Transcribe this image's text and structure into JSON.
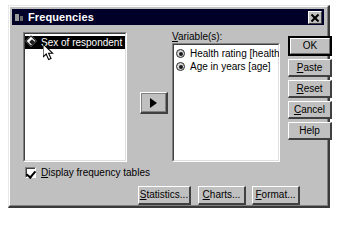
{
  "window": {
    "title": "Frequencies",
    "icon": "spss-dialog-icon",
    "close_label": "X"
  },
  "source_list": {
    "items": [
      {
        "label": "Sex of respondent [sex]",
        "icon": "nominal-variable-icon",
        "selected": true
      }
    ]
  },
  "target_list": {
    "label": "Variable(s):",
    "label_accel": "V",
    "items": [
      {
        "label": "Health rating [health]",
        "icon": "scale-variable-icon",
        "selected": false
      },
      {
        "label": "Age in years [age]",
        "icon": "scale-variable-icon",
        "selected": false
      }
    ]
  },
  "transfer": {
    "name": "move-right-arrow",
    "glyph": "right-triangle"
  },
  "action_buttons": [
    {
      "label": "OK",
      "accel": "",
      "default": true
    },
    {
      "label": "Paste",
      "accel": "P",
      "default": false
    },
    {
      "label": "Reset",
      "accel": "R",
      "default": false
    },
    {
      "label": "Cancel",
      "accel": "C",
      "default": false
    },
    {
      "label": "Help",
      "accel": "",
      "default": false
    }
  ],
  "options": {
    "display_frequency_tables": {
      "label": "Display frequency tables",
      "accel": "D",
      "checked": true
    }
  },
  "sub_dialog_buttons": [
    {
      "label": "Statistics...",
      "accel": "S"
    },
    {
      "label": "Charts...",
      "accel": "C"
    },
    {
      "label": "Format...",
      "accel": "F"
    }
  ],
  "colors": {
    "dialog_face": "#c0c0c0",
    "titlebar": "#000028",
    "titlebar_text": "#ffffff",
    "listbox_bg": "#ffffff",
    "selection_bg": "#000000",
    "selection_text": "#ffffff"
  }
}
